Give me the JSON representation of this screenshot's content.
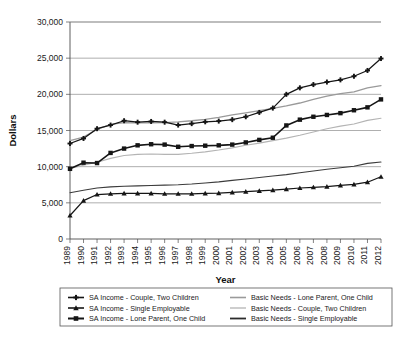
{
  "chart_data": {
    "type": "line",
    "title": "",
    "xlabel": "Year",
    "ylabel": "Dollars",
    "xlim": [
      1989,
      2012
    ],
    "ylim": [
      0,
      30000
    ],
    "ytick_step": 5000,
    "grid": true,
    "legend_position": "bottom",
    "categories": [
      "1989",
      "1990",
      "1991",
      "1992",
      "1993",
      "1994",
      "1995",
      "1996",
      "1997",
      "1998",
      "1999",
      "2000",
      "2001",
      "2002",
      "2003",
      "2004",
      "2005",
      "2006",
      "2007",
      "2008",
      "2009",
      "2010",
      "2011",
      "2012"
    ],
    "ytick_labels": [
      "0",
      "5,000",
      "10,000",
      "15,000",
      "20,000",
      "25,000",
      "30,000"
    ],
    "ytick_values": [
      0,
      5000,
      10000,
      15000,
      20000,
      25000,
      30000
    ],
    "series": [
      {
        "name": "SA Income - Couple, Two Children",
        "marker": "plus",
        "color": "#151515",
        "width": 1.25,
        "values": [
          13200,
          13900,
          15250,
          15750,
          16350,
          16150,
          16250,
          16150,
          15750,
          15950,
          16200,
          16300,
          16500,
          16900,
          17500,
          18100,
          20000,
          20900,
          21350,
          21700,
          22000,
          22500,
          23300,
          24950
        ]
      },
      {
        "name": "SA Income - Single Employable",
        "marker": "triangle",
        "color": "#151515",
        "width": 1.25,
        "values": [
          3250,
          5300,
          6150,
          6250,
          6300,
          6300,
          6300,
          6250,
          6250,
          6250,
          6300,
          6350,
          6450,
          6550,
          6650,
          6750,
          6900,
          7050,
          7150,
          7250,
          7400,
          7550,
          7850,
          8600
        ]
      },
      {
        "name": "SA Income - Lone Parent, One Child",
        "marker": "square",
        "color": "#151515",
        "width": 1.6,
        "values": [
          9700,
          10550,
          10500,
          11900,
          12500,
          12950,
          13100,
          13050,
          12750,
          12850,
          12900,
          12950,
          13050,
          13350,
          13700,
          14000,
          15700,
          16500,
          16900,
          17150,
          17400,
          17800,
          18200,
          19300
        ]
      },
      {
        "name": "Basic Needs - Lone Parent, One Child",
        "marker": "none",
        "color": "#9a9a9a",
        "width": 1.3,
        "values": [
          13600,
          14100,
          15150,
          15850,
          16100,
          16050,
          16050,
          16100,
          16200,
          16350,
          16550,
          16800,
          17150,
          17450,
          17750,
          18050,
          18400,
          18800,
          19300,
          19750,
          20100,
          20350,
          20900,
          21200
        ]
      },
      {
        "name": "Basic Needs - Couple, Two Children",
        "marker": "none",
        "color": "#b4b4b4",
        "width": 1.1,
        "values": [
          9750,
          10200,
          10600,
          11150,
          11550,
          11700,
          11750,
          11700,
          11700,
          11850,
          12050,
          12300,
          12600,
          12950,
          13250,
          13600,
          13950,
          14350,
          14800,
          15250,
          15600,
          15900,
          16400,
          16700
        ]
      },
      {
        "name": "Basic Needs - Single Employable",
        "marker": "none",
        "color": "#3b3b3b",
        "width": 1.1,
        "values": [
          6400,
          6750,
          7050,
          7200,
          7300,
          7350,
          7400,
          7450,
          7500,
          7600,
          7750,
          7900,
          8100,
          8300,
          8500,
          8700,
          8900,
          9150,
          9400,
          9650,
          9850,
          10050,
          10450,
          10650
        ]
      }
    ]
  },
  "legend": {
    "items": [
      {
        "label": "SA Income - Couple, Two Children",
        "marker": "plus",
        "color": "#151515",
        "width": 1.6
      },
      {
        "label": "SA Income - Single Employable",
        "marker": "triangle",
        "color": "#151515",
        "width": 1.6
      },
      {
        "label": "SA Income - Lone Parent, One Child",
        "marker": "square",
        "color": "#151515",
        "width": 2.0
      },
      {
        "label": "Basic Needs - Lone Parent, One Child",
        "marker": "none",
        "color": "#9a9a9a",
        "width": 1.6
      },
      {
        "label": "Basic Needs - Couple, Two Children",
        "marker": "none",
        "color": "#b4b4b4",
        "width": 1.3
      },
      {
        "label": "Basic Needs - Single Employable",
        "marker": "none",
        "color": "#2b2b2b",
        "width": 1.8
      }
    ]
  }
}
